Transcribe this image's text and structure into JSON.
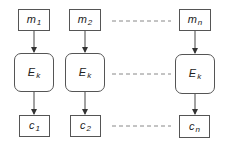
{
  "diagram": {
    "type": "block-cipher-ecb-mode",
    "colors": {
      "stroke": "#555555",
      "dashed": "#888888",
      "text": "#222222",
      "background": "#ffffff"
    },
    "columns": [
      {
        "id": "col1",
        "plaintext": {
          "base": "m",
          "sub": "1"
        },
        "cipher": {
          "base": "E",
          "sub": "k"
        },
        "ciphertext": {
          "base": "c",
          "sub": "1"
        }
      },
      {
        "id": "col2",
        "plaintext": {
          "base": "m",
          "sub": "2"
        },
        "cipher": {
          "base": "E",
          "sub": "k"
        },
        "ciphertext": {
          "base": "c",
          "sub": "2"
        }
      },
      {
        "id": "coln",
        "plaintext": {
          "base": "m",
          "sub": "n"
        },
        "cipher": {
          "base": "E",
          "sub": "k"
        },
        "ciphertext": {
          "base": "c",
          "sub": "n"
        }
      }
    ],
    "edges": [
      {
        "from": "m1",
        "to": "Ek1",
        "style": "arrow"
      },
      {
        "from": "Ek1",
        "to": "c1",
        "style": "arrow"
      },
      {
        "from": "m2",
        "to": "Ek2",
        "style": "arrow"
      },
      {
        "from": "Ek2",
        "to": "c2",
        "style": "arrow"
      },
      {
        "from": "mn",
        "to": "Ekn",
        "style": "arrow"
      },
      {
        "from": "Ekn",
        "to": "cn",
        "style": "arrow"
      },
      {
        "from": "m2",
        "to": "mn",
        "style": "dashed-ellipsis"
      },
      {
        "from": "Ek2",
        "to": "Ekn",
        "style": "dashed-ellipsis"
      },
      {
        "from": "c2",
        "to": "cn",
        "style": "dashed-ellipsis"
      }
    ]
  }
}
